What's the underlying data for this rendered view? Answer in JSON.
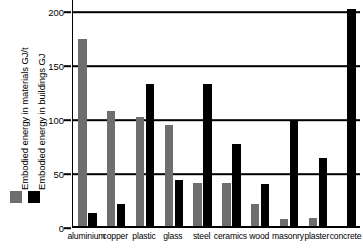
{
  "chart_data": {
    "type": "bar",
    "title": "",
    "xlabel": "",
    "ylabel": "",
    "ylim": [
      0,
      200
    ],
    "grid": true,
    "legend_position": "left-vertical",
    "categories": [
      "aluminium",
      "copper",
      "plastic",
      "glass",
      "steel",
      "ceramics",
      "wood",
      "masonry",
      "plaster",
      "concrete"
    ],
    "y_ticks": [
      0,
      50,
      100,
      150,
      200
    ],
    "series": [
      {
        "name": "Embodied energy in materials GJ/t",
        "color": "#6e6e6e",
        "values": [
          175,
          108,
          103,
          95,
          42,
          42,
          22,
          8,
          9,
          1
        ]
      },
      {
        "name": "Embodied energy in buildings GJ",
        "color": "#000000",
        "values": [
          14,
          22,
          133,
          44,
          133,
          78,
          41,
          100,
          65,
          203
        ]
      }
    ]
  },
  "legend": {
    "items": [
      {
        "label": "Embodied energy in materials GJ/t",
        "color": "#6e6e6e"
      },
      {
        "label": "Embodied energy in buildings GJ",
        "color": "#000000"
      }
    ]
  },
  "axis": {
    "y_tick_labels": [
      "200",
      "150",
      "100",
      "50",
      "0"
    ]
  }
}
